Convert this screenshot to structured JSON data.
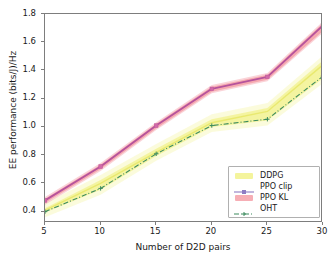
{
  "chart_data": {
    "type": "line",
    "title": "",
    "xlabel": "Number of D2D pairs",
    "ylabel": "EE performance (bits/J)/Hz",
    "x": [
      5,
      10,
      15,
      20,
      25,
      30
    ],
    "xlim": [
      5,
      30
    ],
    "ylim": [
      0.32,
      1.8
    ],
    "xticks": [
      "5",
      "10",
      "15",
      "20",
      "25",
      "30"
    ],
    "yticks": [
      "0.4",
      "0.6",
      "0.8",
      "1.0",
      "1.2",
      "1.4",
      "1.6",
      "1.8"
    ],
    "grid": false,
    "legend_position": "lower right",
    "series": [
      {
        "name": "DDPG",
        "style": "band",
        "color": "#f2f28c",
        "values": [
          0.41,
          0.6,
          0.82,
          1.03,
          1.11,
          1.44
        ],
        "band_low": [
          0.395,
          0.555,
          0.795,
          1.0,
          1.045,
          1.345
        ],
        "band_high": [
          0.425,
          0.625,
          0.845,
          1.055,
          1.135,
          1.47
        ]
      },
      {
        "name": "PPO clip",
        "style": "solid-marker",
        "color": "#b5539c",
        "values": [
          0.48,
          0.72,
          1.01,
          1.27,
          1.355,
          1.72
        ]
      },
      {
        "name": "PPO KL",
        "style": "band",
        "color": "#f4a0a8",
        "values": [
          0.475,
          0.715,
          1.005,
          1.265,
          1.35,
          1.705
        ],
        "band_low": [
          0.462,
          0.7,
          0.99,
          1.25,
          1.335,
          1.68
        ],
        "band_high": [
          0.492,
          0.733,
          1.022,
          1.285,
          1.37,
          1.735
        ]
      },
      {
        "name": "OHT",
        "style": "dashdot-marker",
        "color": "#3d8b5f",
        "values": [
          0.4,
          0.565,
          0.81,
          1.01,
          1.055,
          1.36
        ]
      }
    ]
  },
  "legend": {
    "items": [
      {
        "label": "DDPG",
        "key": "patch",
        "color": "#f2f28c"
      },
      {
        "label": "PPO clip",
        "key": "line-marker",
        "color": "#8e7cc3"
      },
      {
        "label": "PPO KL",
        "key": "patch",
        "color": "#f4a0a8"
      },
      {
        "label": "OHT",
        "key": "dashdot-marker",
        "color": "#3d8b5f"
      }
    ]
  }
}
